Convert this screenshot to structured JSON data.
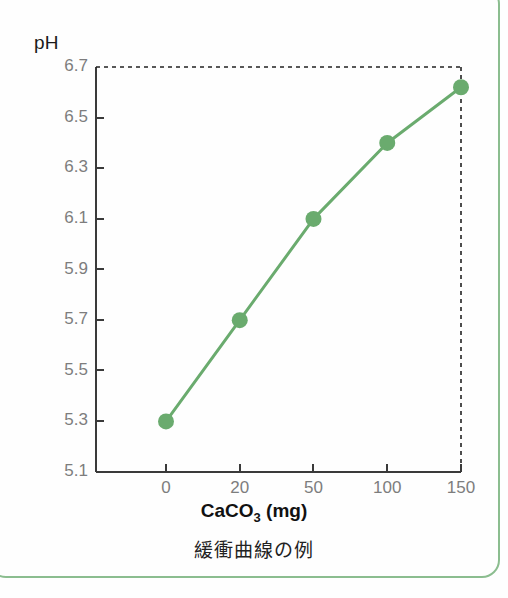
{
  "figure": {
    "caption": "緩衝曲線の例",
    "frame_color": "#8bbd8f"
  },
  "axis": {
    "y_title": "pH",
    "x_title_main": "CaCO",
    "x_title_sub": "3",
    "x_title_unit": " (mg)"
  },
  "chart_data": {
    "type": "line",
    "title": "",
    "subtitle": "",
    "xlabel": "CaCO3 (mg)",
    "ylabel": "pH",
    "categories": [
      "0",
      "20",
      "50",
      "100",
      "150"
    ],
    "x": [
      0,
      20,
      50,
      100,
      150
    ],
    "values": [
      5.3,
      5.7,
      6.1,
      6.4,
      6.62
    ],
    "series": [
      {
        "name": "pH",
        "values": [
          5.3,
          5.7,
          6.1,
          6.4,
          6.62
        ],
        "color": "#6aab6e",
        "marker": "circle"
      }
    ],
    "ylim": [
      5.1,
      6.7
    ],
    "y_ticks": [
      "6.7",
      "6.5",
      "6.3",
      "6.1",
      "5.9",
      "5.7",
      "5.5",
      "5.3",
      "5.1"
    ],
    "y_tick_values": [
      6.7,
      6.5,
      6.3,
      6.1,
      5.9,
      5.7,
      5.5,
      5.3,
      5.1
    ],
    "x_ticks": [
      "0",
      "20",
      "50",
      "100",
      "150"
    ],
    "grid": false,
    "legend": "none",
    "annotations": [
      "dotted boundary line at pH 6.7 across top of plot",
      "dotted vertical boundary line at CaCO3 = 150 mg"
    ],
    "axis_spacing": "categorical (evenly spaced x ticks)",
    "line_color": "#6aab6e",
    "marker_color": "#6aab6e"
  }
}
